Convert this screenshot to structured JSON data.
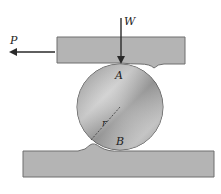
{
  "diagram": {
    "labels": {
      "force_horizontal": "P",
      "force_vertical": "W",
      "contact_top": "A",
      "contact_bottom": "B",
      "radius": "r"
    },
    "colors": {
      "plate_fill": "#b4b4b4",
      "plate_stroke": "#6e6e6e",
      "cylinder_light": "#e6e6e6",
      "cylinder_dark": "#8c8c8c",
      "arrow": "#2a2a2a"
    }
  }
}
